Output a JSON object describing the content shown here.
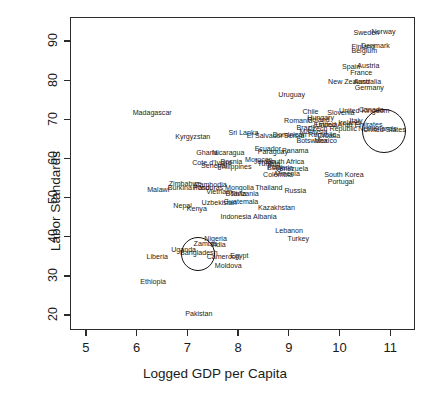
{
  "chart_data": {
    "type": "scatter",
    "title": "",
    "xlabel": "Logged GDP per Capita",
    "ylabel": "Labor Standards",
    "xlim": [
      4.7,
      11.5
    ],
    "ylim": [
      16,
      96
    ],
    "xticks": [
      5,
      6,
      7,
      8,
      9,
      10,
      11
    ],
    "yticks": [
      20,
      30,
      40,
      50,
      60,
      70,
      80,
      90
    ],
    "grid": false,
    "legend": null,
    "marker_style": "text-labels-only",
    "points": [
      {
        "label": "Madagascar",
        "x": 6.3,
        "y": 71.5
      },
      {
        "label": "Kyrgyzstan",
        "x": 7.1,
        "y": 65.3
      },
      {
        "label": "Ghana",
        "x": 7.38,
        "y": 61.3
      },
      {
        "label": "Nicaragua",
        "x": 7.8,
        "y": 61.3
      },
      {
        "label": "Sri Lanka",
        "x": 8.1,
        "y": 66.3
      },
      {
        "label": "Cote d'Ivoire",
        "x": 7.48,
        "y": 58.8
      },
      {
        "label": "Senegal",
        "x": 7.52,
        "y": 57.8
      },
      {
        "label": "Philippines",
        "x": 7.92,
        "y": 57.7
      },
      {
        "label": "Zimbabwe",
        "x": 6.95,
        "y": 53.4
      },
      {
        "label": "Burkina Faso",
        "x": 7.02,
        "y": 52.2
      },
      {
        "label": "Cambodia",
        "x": 7.45,
        "y": 53.0
      },
      {
        "label": "Honduras",
        "x": 7.4,
        "y": 52.3
      },
      {
        "label": "Mongolia",
        "x": 8.02,
        "y": 52.3
      },
      {
        "label": "Vietnam",
        "x": 7.62,
        "y": 51.3
      },
      {
        "label": "Bolivia",
        "x": 7.95,
        "y": 50.8
      },
      {
        "label": "Tanzania",
        "x": 8.12,
        "y": 50.7
      },
      {
        "label": "Malawi",
        "x": 6.42,
        "y": 51.8
      },
      {
        "label": "Nepal",
        "x": 6.9,
        "y": 47.6
      },
      {
        "label": "Kenya",
        "x": 7.18,
        "y": 47.0
      },
      {
        "label": "Uzbekistan",
        "x": 7.62,
        "y": 48.4
      },
      {
        "label": "Bosnia",
        "x": 7.86,
        "y": 58.9
      },
      {
        "label": "Guatemala",
        "x": 8.05,
        "y": 48.7
      },
      {
        "label": "Indonesia",
        "x": 7.95,
        "y": 45.0
      },
      {
        "label": "Albania",
        "x": 8.52,
        "y": 45.0
      },
      {
        "label": "Thailand",
        "x": 8.6,
        "y": 52.2
      },
      {
        "label": "Russia",
        "x": 9.12,
        "y": 51.4
      },
      {
        "label": "Kazakhstan",
        "x": 8.75,
        "y": 47.2
      },
      {
        "label": "Lebanon",
        "x": 9.0,
        "y": 41.4
      },
      {
        "label": "Turkey",
        "x": 9.18,
        "y": 39.2
      },
      {
        "label": "Nigeria",
        "x": 7.55,
        "y": 39.3
      },
      {
        "label": "Zambia",
        "x": 7.35,
        "y": 38.0
      },
      {
        "label": "India",
        "x": 7.6,
        "y": 37.7
      },
      {
        "label": "Uganda",
        "x": 6.92,
        "y": 36.4
      },
      {
        "label": "Bangladesh",
        "x": 7.22,
        "y": 35.7
      },
      {
        "label": "Cameroon",
        "x": 7.7,
        "y": 34.7
      },
      {
        "label": "Egypt",
        "x": 8.02,
        "y": 34.8
      },
      {
        "label": "Liberia",
        "x": 6.4,
        "y": 34.7
      },
      {
        "label": "Moldova",
        "x": 7.8,
        "y": 32.4
      },
      {
        "label": "Ethiopia",
        "x": 6.32,
        "y": 28.2
      },
      {
        "label": "Pakistan",
        "x": 7.22,
        "y": 20.2
      },
      {
        "label": "Uruguay",
        "x": 9.05,
        "y": 76.0
      },
      {
        "label": "Chile",
        "x": 9.42,
        "y": 71.6
      },
      {
        "label": "Slovenia",
        "x": 10.02,
        "y": 71.4
      },
      {
        "label": "Romania",
        "x": 9.18,
        "y": 69.5
      },
      {
        "label": "Hungary",
        "x": 9.62,
        "y": 70.3
      },
      {
        "label": "Poland",
        "x": 9.58,
        "y": 69.7
      },
      {
        "label": "Estonia",
        "x": 9.72,
        "y": 68.4
      },
      {
        "label": "United Arab Emirates",
        "x": 10.18,
        "y": 68.3
      },
      {
        "label": "Brazil",
        "x": 9.32,
        "y": 67.7
      },
      {
        "label": "Malaysia",
        "x": 9.48,
        "y": 66.6
      },
      {
        "label": "Czech Republic",
        "x": 9.85,
        "y": 67.5
      },
      {
        "label": "Serbia",
        "x": 9.1,
        "y": 65.7
      },
      {
        "label": "Dominican Republic",
        "x": 9.3,
        "y": 65.8
      },
      {
        "label": "Croatia",
        "x": 9.78,
        "y": 65.6
      },
      {
        "label": "El Salvador",
        "x": 8.52,
        "y": 65.7
      },
      {
        "label": "Botswana",
        "x": 9.45,
        "y": 64.4
      },
      {
        "label": "Mexico",
        "x": 9.72,
        "y": 64.2
      },
      {
        "label": "Ecuador",
        "x": 8.58,
        "y": 62.2
      },
      {
        "label": "Paraguay",
        "x": 8.68,
        "y": 61.6
      },
      {
        "label": "Panama",
        "x": 9.12,
        "y": 61.7
      },
      {
        "label": "Morocco",
        "x": 8.4,
        "y": 59.4
      },
      {
        "label": "Jordan",
        "x": 8.52,
        "y": 59.0
      },
      {
        "label": "South Africa",
        "x": 8.92,
        "y": 58.9
      },
      {
        "label": "Tunisia",
        "x": 8.6,
        "y": 58.5
      },
      {
        "label": "Peru",
        "x": 8.72,
        "y": 57.7
      },
      {
        "label": "Bulgaria",
        "x": 8.82,
        "y": 57.4
      },
      {
        "label": "Venezuela",
        "x": 9.05,
        "y": 57.2
      },
      {
        "label": "Colombia",
        "x": 8.78,
        "y": 55.6
      },
      {
        "label": "Armenia",
        "x": 8.95,
        "y": 56.0
      },
      {
        "label": "Sweden",
        "x": 10.52,
        "y": 92.0
      },
      {
        "label": "Norway",
        "x": 10.86,
        "y": 92.2
      },
      {
        "label": "Finland",
        "x": 10.46,
        "y": 88.3
      },
      {
        "label": "Denmark",
        "x": 10.7,
        "y": 88.6
      },
      {
        "label": "Belgium",
        "x": 10.48,
        "y": 87.4
      },
      {
        "label": "Spain",
        "x": 10.22,
        "y": 83.3
      },
      {
        "label": "Austria",
        "x": 10.56,
        "y": 83.6
      },
      {
        "label": "France",
        "x": 10.42,
        "y": 81.7
      },
      {
        "label": "New Zealand",
        "x": 10.18,
        "y": 79.4
      },
      {
        "label": "Australia",
        "x": 10.54,
        "y": 79.3
      },
      {
        "label": "Germany",
        "x": 10.58,
        "y": 77.9
      },
      {
        "label": "United Kingdom",
        "x": 10.48,
        "y": 72.0
      },
      {
        "label": "Canada",
        "x": 10.62,
        "y": 72.3
      },
      {
        "label": "Italy",
        "x": 10.32,
        "y": 69.4
      },
      {
        "label": "Ireland",
        "x": 10.18,
        "y": 68.9
      },
      {
        "label": "Netherlands",
        "x": 10.74,
        "y": 67.5
      },
      {
        "label": "United States",
        "x": 10.88,
        "y": 67.2
      },
      {
        "label": "South Korea",
        "x": 10.08,
        "y": 55.6
      },
      {
        "label": "Portugal",
        "x": 10.02,
        "y": 53.8
      }
    ],
    "annotations": [
      {
        "type": "circle",
        "target": "United States",
        "x": 10.86,
        "y": 67.2,
        "radius_px": 22
      },
      {
        "type": "circle",
        "target": "Bangladesh",
        "x": 7.2,
        "y": 35.6,
        "radius_px": 17
      }
    ]
  }
}
